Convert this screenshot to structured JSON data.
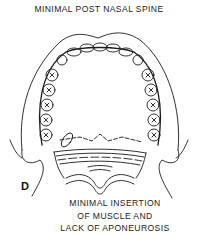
{
  "figure": {
    "panel_letter": "D",
    "top_label": "MINIMAL POST NASAL SPINE",
    "bottom_label_lines": [
      "MINIMAL INSERTION",
      "OF MUSCLE AND",
      "LACK OF APONEUROSIS"
    ],
    "line_color": "#1a1a1a",
    "background_color": "#ffffff"
  }
}
